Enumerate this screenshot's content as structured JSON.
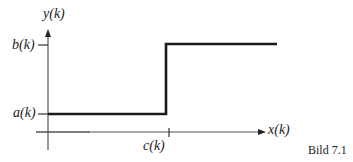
{
  "diagram": {
    "type": "step-function",
    "axes": {
      "x_label": "x(k)",
      "y_label": "y(k)"
    },
    "levels": {
      "low_label": "a(k)",
      "high_label": "b(k)"
    },
    "step_position_label": "c(k)",
    "caption": "Bild 7.1",
    "line_color": "#1a1a1a",
    "axis_color": "#555555"
  }
}
